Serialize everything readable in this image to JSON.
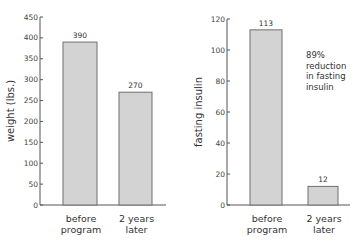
{
  "chart_data": [
    {
      "type": "bar",
      "title": "",
      "xlabel": "",
      "ylabel": "weight (lbs.)",
      "categories": [
        "before program",
        "2 years later"
      ],
      "category_lines": [
        [
          "before",
          "program"
        ],
        [
          "2 years",
          "later"
        ]
      ],
      "values": [
        390,
        270
      ],
      "value_labels": [
        "390",
        "270"
      ],
      "ylim": [
        0,
        450
      ],
      "yticks": [
        0,
        50,
        100,
        150,
        200,
        250,
        300,
        350,
        400,
        450
      ],
      "grid": false,
      "legend": null,
      "bar_fill": "#d3d3d3",
      "bar_stroke": "#6f6f6f"
    },
    {
      "type": "bar",
      "title": "",
      "xlabel": "",
      "ylabel": "fasting insulin",
      "categories": [
        "before program",
        "2 years later"
      ],
      "category_lines": [
        [
          "before",
          "program"
        ],
        [
          "2 years",
          "later"
        ]
      ],
      "values": [
        113,
        12
      ],
      "value_labels": [
        "113",
        "12"
      ],
      "ylim": [
        0,
        120
      ],
      "yticks": [
        0,
        20,
        40,
        60,
        80,
        100,
        120
      ],
      "grid": false,
      "legend": null,
      "annotations": [
        [
          "89%",
          "reduction",
          "in fasting",
          "insulin"
        ]
      ],
      "bar_fill": "#d3d3d3",
      "bar_stroke": "#6f6f6f"
    }
  ]
}
